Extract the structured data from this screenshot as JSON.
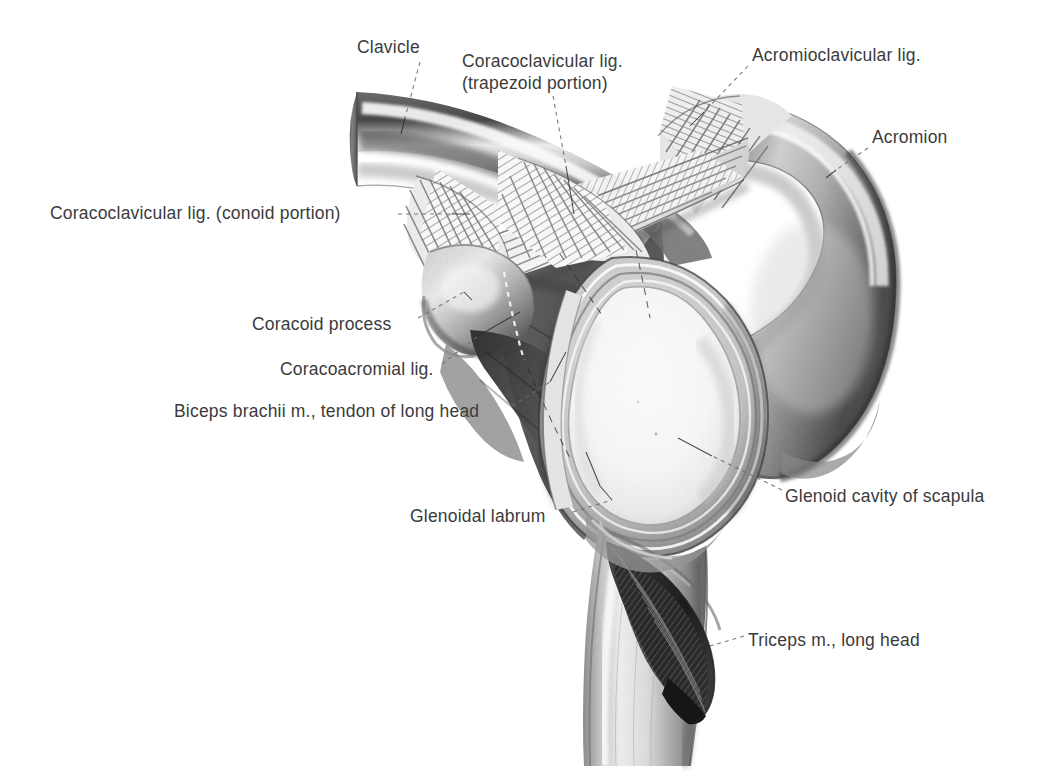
{
  "plate": {
    "title": "Shoulder joint, lateral view of glenoid cavity with coracoacromial arch",
    "kind": "anatomical-illustration",
    "medium": "graphite / halftone engraving",
    "background_color": "#ffffff",
    "ink_color": "#3b3b3b",
    "width": 1048,
    "height": 771
  },
  "labels": [
    {
      "id": "clavicle",
      "text": "Clavicle",
      "x": 357,
      "y": 36,
      "align": "left",
      "leader": {
        "from": [
          420,
          62
        ],
        "to": [
          405,
          118
        ],
        "style": "dashed"
      }
    },
    {
      "id": "coracoclavicular-trapezoid",
      "text": "Coracoclavicular lig.\n(trapezoid portion)",
      "x": 462,
      "y": 50,
      "align": "left",
      "leader": {
        "from": [
          553,
          96
        ],
        "to": [
          566,
          162
        ],
        "style": "dashed"
      }
    },
    {
      "id": "acromioclavicular",
      "text": "Acromioclavicular lig.",
      "x": 752,
      "y": 44,
      "align": "left",
      "leader": {
        "from": [
          748,
          66
        ],
        "to": [
          706,
          110
        ],
        "style": "dashed"
      }
    },
    {
      "id": "acromion",
      "text": "Acromion",
      "x": 872,
      "y": 126,
      "align": "left",
      "leader": {
        "from": [
          868,
          148
        ],
        "to": [
          838,
          168
        ],
        "style": "dashed"
      }
    },
    {
      "id": "coracoclavicular-conoid",
      "text": "Coracoclavicular lig. (conoid portion)",
      "x": 50,
      "y": 202,
      "align": "left",
      "leader": {
        "from": [
          400,
          214
        ],
        "to": [
          452,
          214
        ],
        "style": "dashed"
      }
    },
    {
      "id": "coracoid-process",
      "text": "Coracoid process",
      "x": 252,
      "y": 313,
      "align": "left",
      "leader": {
        "from": [
          418,
          318
        ],
        "to": [
          462,
          292
        ],
        "style": "dashed"
      }
    },
    {
      "id": "coracoacromial",
      "text": "Coracoacromial lig.",
      "x": 280,
      "y": 358,
      "align": "left",
      "leader": {
        "from": [
          442,
          364
        ],
        "to": [
          476,
          336
        ],
        "style": "dashed"
      }
    },
    {
      "id": "biceps-tendon-long-head",
      "text": "Biceps brachii m., tendon of long head",
      "x": 174,
      "y": 400,
      "align": "left",
      "leader": {
        "from": [
          512,
          406
        ],
        "to": [
          548,
          382
        ],
        "style": "dashed"
      }
    },
    {
      "id": "glenoid-cavity",
      "text": "Glenoid cavity of scapula",
      "x": 785,
      "y": 485,
      "align": "left",
      "leader": {
        "from": [
          780,
          492
        ],
        "to": [
          714,
          456
        ],
        "style": "dashed"
      }
    },
    {
      "id": "glenoidal-labrum",
      "text": "Glenoidal labrum",
      "x": 410,
      "y": 505,
      "align": "left",
      "leader": {
        "from": [
          573,
          513
        ],
        "to": [
          610,
          500
        ],
        "style": "dashed"
      }
    },
    {
      "id": "triceps-long-head",
      "text": "Triceps m., long head",
      "x": 748,
      "y": 629,
      "align": "left",
      "leader": {
        "from": [
          744,
          637
        ],
        "to": [
          712,
          645
        ],
        "style": "dashed"
      }
    }
  ],
  "structures": [
    {
      "id": "clavicle-shaft",
      "name": "Clavicle (sectioned medial end)"
    },
    {
      "id": "acromion-body",
      "name": "Acromion"
    },
    {
      "id": "scapular-spine",
      "name": "Scapula body"
    },
    {
      "id": "coracoid",
      "name": "Coracoid process"
    },
    {
      "id": "conoid-lig",
      "name": "Coracoclavicular ligament, conoid portion"
    },
    {
      "id": "trapezoid-lig",
      "name": "Coracoclavicular ligament, trapezoid portion"
    },
    {
      "id": "ac-lig",
      "name": "Acromioclavicular ligament"
    },
    {
      "id": "ca-lig",
      "name": "Coracoacromial ligament"
    },
    {
      "id": "glenoid-fossa",
      "name": "Glenoid cavity"
    },
    {
      "id": "labrum-ring",
      "name": "Glenoidal labrum"
    },
    {
      "id": "biceps-tendon",
      "name": "Biceps brachii tendon, long head"
    },
    {
      "id": "triceps-tendon",
      "name": "Triceps, long head"
    },
    {
      "id": "humerus-shaft",
      "name": "Lateral border / shaft"
    }
  ]
}
